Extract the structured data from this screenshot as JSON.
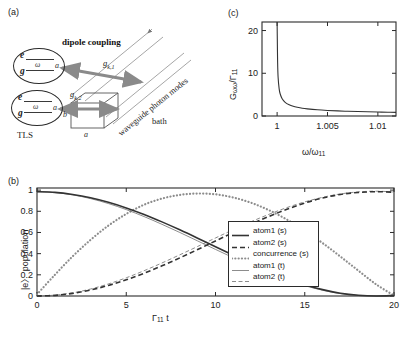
{
  "figure": {
    "panels": {
      "a": "(a)",
      "b": "(b)",
      "c": "(c)"
    }
  },
  "panel_a": {
    "title_dipole": "dipole coupling",
    "tls_caption": "TLS",
    "waveguide_label": "waveguide photon modes",
    "bath_label": "bath",
    "coupling_1": "g",
    "coupling_1_sub": "k,1",
    "coupling_2": "g",
    "coupling_2_sub": "k,2",
    "atom1": {
      "excited": "e",
      "ground": "g",
      "omega": "ω",
      "side": "a"
    },
    "atom2": {
      "excited": "e",
      "ground": "g",
      "omega": "ω",
      "side": "a"
    },
    "dim_a": "a",
    "dim_b": "b"
  },
  "panel_c": {
    "chart_data": {
      "type": "line",
      "title": "",
      "xlabel": "ω/ω₁₁",
      "ylabel": "Gωω/Γ₁₁",
      "xlim": [
        0.9985,
        1.0118
      ],
      "ylim": [
        0,
        22
      ],
      "xticks": [
        1,
        1.005,
        1.01
      ],
      "xtick_labels": [
        "1",
        "1.005",
        "1.01"
      ],
      "yticks": [
        0,
        10,
        20
      ],
      "ytick_labels": [
        "0",
        "10",
        "20"
      ],
      "grid": false,
      "legend": "none",
      "series": [
        {
          "name": "G_omega_omega over Gamma_11",
          "description": "inverse-square-root divergence at ω/ω₁₁ = 1",
          "x": [
            1.0,
            1.00002,
            1.00005,
            1.0001,
            1.0002,
            1.0003,
            1.0005,
            1.0008,
            1.0012,
            1.0016,
            1.002,
            1.0025,
            1.003,
            1.004,
            1.005,
            1.006,
            1.007,
            1.008,
            1.009,
            1.01,
            1.011,
            1.0118
          ],
          "y": [
            22.0,
            18.0,
            12.6,
            9.0,
            6.4,
            5.2,
            4.05,
            3.2,
            2.62,
            2.27,
            2.04,
            1.82,
            1.67,
            1.45,
            1.3,
            1.19,
            1.11,
            1.04,
            0.98,
            0.93,
            0.89,
            0.86
          ]
        }
      ]
    },
    "x_axis_label_main": "ω/ω",
    "x_axis_label_sub": "11",
    "y_axis_label_main": "G",
    "y_axis_label_sub1": "ωω",
    "y_axis_label_slash": "/Γ",
    "y_axis_label_sub2": "11"
  },
  "panel_b": {
    "chart_data": {
      "type": "line",
      "title": "",
      "xlabel": "Γ₁₁ t",
      "ylabel": "|e⟩ population",
      "xlim": [
        0,
        20
      ],
      "ylim": [
        0,
        1.02
      ],
      "xticks": [
        0,
        5,
        10,
        15,
        20
      ],
      "xtick_labels": [
        "0",
        "5",
        "10",
        "15",
        "20"
      ],
      "yticks": [
        0,
        0.2,
        0.4,
        0.6,
        0.8,
        1
      ],
      "ytick_labels": [
        "0",
        "0.2",
        "0.4",
        "0.6",
        "0.8",
        "1"
      ],
      "grid": false,
      "legend": "inside-right",
      "x": [
        0,
        1,
        2,
        3,
        4,
        5,
        6,
        7,
        8,
        9,
        10,
        11,
        12,
        13,
        14,
        15,
        16,
        17,
        18,
        19,
        20
      ],
      "series": [
        {
          "name": "atom1 (s)",
          "style": "solid",
          "width": 1.6,
          "values": [
            0.985,
            0.979,
            0.959,
            0.928,
            0.885,
            0.832,
            0.77,
            0.7,
            0.625,
            0.546,
            0.465,
            0.385,
            0.307,
            0.233,
            0.166,
            0.107,
            0.06,
            0.026,
            0.007,
            0.0,
            0.005
          ]
        },
        {
          "name": "atom2 (s)",
          "style": "dashed",
          "width": 1.6,
          "values": [
            0.0,
            0.006,
            0.025,
            0.057,
            0.1,
            0.153,
            0.215,
            0.285,
            0.36,
            0.439,
            0.52,
            0.6,
            0.678,
            0.752,
            0.819,
            0.878,
            0.925,
            0.959,
            0.978,
            0.985,
            0.98
          ]
        },
        {
          "name": "concurrence (s)",
          "style": "dotted",
          "width": 2.2,
          "values": [
            0.015,
            0.2,
            0.375,
            0.53,
            0.665,
            0.775,
            0.862,
            0.92,
            0.955,
            0.968,
            0.96,
            0.93,
            0.88,
            0.81,
            0.722,
            0.618,
            0.5,
            0.372,
            0.24,
            0.11,
            0.005
          ]
        },
        {
          "name": "atom1 (t)",
          "style": "solid",
          "width": 0.8,
          "values": [
            0.985,
            0.977,
            0.955,
            0.92,
            0.873,
            0.816,
            0.75,
            0.677,
            0.6,
            0.52,
            0.44,
            0.361,
            0.286,
            0.216,
            0.153,
            0.098,
            0.054,
            0.022,
            0.005,
            0.0,
            0.008
          ]
        },
        {
          "name": "atom2 (t)",
          "style": "dashed",
          "width": 0.8,
          "values": [
            0.0,
            0.008,
            0.03,
            0.066,
            0.114,
            0.172,
            0.239,
            0.312,
            0.389,
            0.468,
            0.548,
            0.627,
            0.702,
            0.772,
            0.835,
            0.889,
            0.932,
            0.964,
            0.983,
            0.99,
            0.982
          ]
        }
      ]
    },
    "legend_items": [
      {
        "label": "atom1 (s)",
        "style": "solid",
        "width": 1.6
      },
      {
        "label": "atom2 (s)",
        "style": "dashed",
        "width": 1.6
      },
      {
        "label": "concurrence (s)",
        "style": "dotted",
        "width": 2.2
      },
      {
        "label": "atom1 (t)",
        "style": "solid",
        "width": 0.8
      },
      {
        "label": "atom2 (t)",
        "style": "dashed",
        "width": 0.8
      }
    ],
    "x_axis_label_main": "Γ",
    "x_axis_label_sub": "11",
    "x_axis_label_tail": " t",
    "y_axis_label": "|e〉 population"
  },
  "colors": {
    "ink": "#1a1a1a",
    "axis": "#2b2b2b",
    "curve": "#333333",
    "curve_light": "#6f6f6f",
    "arrow": "#8a8a8a",
    "waveguide": "#6a6a6a"
  }
}
